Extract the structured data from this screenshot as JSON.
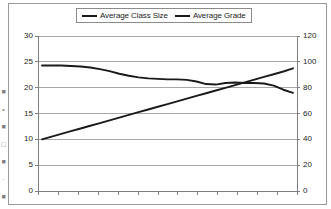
{
  "figure": {
    "background_color": "#ffffff",
    "frame_color": "#9a9a9a",
    "plot_area": {
      "left": 38,
      "top": 36,
      "right": 297,
      "bottom": 191
    }
  },
  "legend": {
    "position": "top-center",
    "border_color": "#8c8c8c",
    "entries": [
      {
        "label": "Average Class Size",
        "color": "#1a1a1a",
        "marker": "line-swatch"
      },
      {
        "label": "Average Grade",
        "color": "#1a1a1a",
        "marker": "line-swatch"
      }
    ]
  },
  "left_axis": {
    "ticks": [
      "30",
      "25",
      "20",
      "15",
      "10",
      "5",
      "0"
    ],
    "min": 0,
    "max": 30,
    "step": 5,
    "color": "#1c1c1c"
  },
  "right_axis": {
    "ticks": [
      "120",
      "100",
      "80",
      "60",
      "40",
      "20",
      "0"
    ],
    "min": 0,
    "max": 120,
    "step": 20,
    "color": "#1c1c1c"
  },
  "x_axis": {
    "tick_count": 14,
    "tick_labels": [],
    "color": "#7f7f7f"
  },
  "gridlines": {
    "horizontal": true,
    "vertical": false,
    "color": "#a8a8a8"
  },
  "left_margin_artifacts": [
    "■",
    "•",
    "■",
    "□",
    "■",
    "·",
    "■"
  ],
  "chart_data": {
    "type": "line",
    "title": "",
    "xlabel": "",
    "ylabel": "",
    "grid": true,
    "legend_position": "top-center",
    "x": [
      0,
      1,
      2,
      3,
      4,
      5,
      6,
      7,
      8,
      9,
      10,
      11,
      12,
      13,
      14,
      15,
      16,
      17,
      18,
      19,
      20,
      21,
      22,
      23,
      24,
      25,
      26
    ],
    "axes": [
      {
        "name": "left",
        "label": "Average Class Size",
        "ylim": [
          0,
          30
        ],
        "ticks": [
          0,
          5,
          10,
          15,
          20,
          25,
          30
        ]
      },
      {
        "name": "right",
        "label": "Average Grade",
        "ylim": [
          0,
          120
        ],
        "ticks": [
          0,
          20,
          40,
          60,
          80,
          100,
          120
        ]
      }
    ],
    "series": [
      {
        "name": "Average Class Size",
        "axis": "left",
        "color": "#1a1a1a",
        "values": [
          24.3,
          24.3,
          24.3,
          24.2,
          24.1,
          23.9,
          23.6,
          23.2,
          22.7,
          22.3,
          22.0,
          21.8,
          21.7,
          21.6,
          21.6,
          21.5,
          21.2,
          20.7,
          20.6,
          20.9,
          21.0,
          20.9,
          20.9,
          20.8,
          20.4,
          19.6,
          19.0
        ]
      },
      {
        "name": "Average Grade",
        "axis": "right",
        "color": "#1a1a1a",
        "values": [
          40,
          42.1,
          44.2,
          46.3,
          48.4,
          50.5,
          52.6,
          54.7,
          56.8,
          58.9,
          61.0,
          63.1,
          65.2,
          67.3,
          69.4,
          71.5,
          73.6,
          75.7,
          77.8,
          79.9,
          82.0,
          84.1,
          86.2,
          88.3,
          90.4,
          92.5,
          95.0
        ]
      }
    ],
    "annotations": [
      {
        "text": "series cross near x=20",
        "type": "intersection"
      }
    ]
  }
}
